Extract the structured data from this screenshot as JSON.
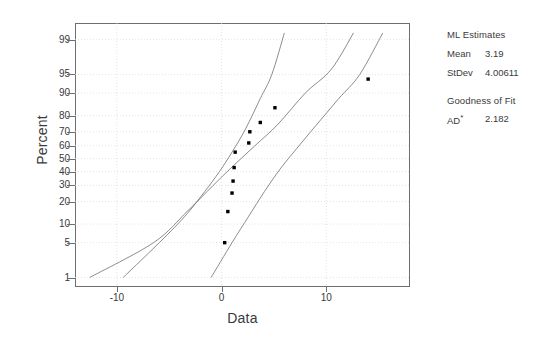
{
  "chart_data": {
    "type": "scatter",
    "title": "",
    "subtitle": "",
    "xlabel": "Data",
    "ylabel": "Percent",
    "grid": true,
    "legend_position": "right",
    "xlim": [
      -14,
      18
    ],
    "xticks": [
      -10,
      0,
      10
    ],
    "xtick_labels": [
      "-10",
      "0",
      "10"
    ],
    "ylim_percent": [
      0.6,
      99.6
    ],
    "yticks": [
      99,
      95,
      90,
      80,
      70,
      60,
      50,
      40,
      30,
      20,
      10,
      5,
      1
    ],
    "ytick_labels": [
      "99",
      "95",
      "90",
      "80",
      "70",
      "60",
      "50",
      "40",
      "30",
      "20",
      "10",
      "5",
      "1"
    ],
    "series": [
      {
        "name": "Data points",
        "type": "scatter",
        "marker": "square",
        "color": "#000000",
        "points": [
          {
            "x": 0.3,
            "percent": 5
          },
          {
            "x": 0.6,
            "percent": 15
          },
          {
            "x": 1.0,
            "percent": 25
          },
          {
            "x": 1.1,
            "percent": 33
          },
          {
            "x": 1.2,
            "percent": 43
          },
          {
            "x": 1.3,
            "percent": 55
          },
          {
            "x": 2.6,
            "percent": 62
          },
          {
            "x": 2.7,
            "percent": 70
          },
          {
            "x": 3.7,
            "percent": 76
          },
          {
            "x": 5.1,
            "percent": 84
          },
          {
            "x": 14.0,
            "percent": 94
          }
        ]
      },
      {
        "name": "Fitted normal line",
        "type": "line",
        "color": "#6e6e6e",
        "points": [
          {
            "x": -12.6,
            "percent": 1
          },
          {
            "x": -6.5,
            "percent": 5
          },
          {
            "x": -3.3,
            "percent": 15
          },
          {
            "x": -0.8,
            "percent": 30
          },
          {
            "x": 1.2,
            "percent": 45
          },
          {
            "x": 3.2,
            "percent": 60
          },
          {
            "x": 5.4,
            "percent": 75
          },
          {
            "x": 8.0,
            "percent": 90
          },
          {
            "x": 10.5,
            "percent": 96
          },
          {
            "x": 12.6,
            "percent": 99.3
          }
        ]
      },
      {
        "name": "Lower confidence bound",
        "type": "line",
        "color": "#6e6e6e",
        "points": [
          {
            "x": -9.4,
            "percent": 1
          },
          {
            "x": -5.5,
            "percent": 6
          },
          {
            "x": -3.3,
            "percent": 14
          },
          {
            "x": -1.6,
            "percent": 26
          },
          {
            "x": -0.2,
            "percent": 40
          },
          {
            "x": 1.0,
            "percent": 55
          },
          {
            "x": 2.3,
            "percent": 72
          },
          {
            "x": 3.7,
            "percent": 88
          },
          {
            "x": 4.8,
            "percent": 95
          },
          {
            "x": 6.0,
            "percent": 99.3
          }
        ]
      },
      {
        "name": "Upper confidence bound",
        "type": "line",
        "color": "#6e6e6e",
        "points": [
          {
            "x": -1.0,
            "percent": 1
          },
          {
            "x": 1.0,
            "percent": 5
          },
          {
            "x": 2.6,
            "percent": 13
          },
          {
            "x": 4.1,
            "percent": 26
          },
          {
            "x": 5.6,
            "percent": 42
          },
          {
            "x": 7.2,
            "percent": 58
          },
          {
            "x": 9.0,
            "percent": 74
          },
          {
            "x": 11.2,
            "percent": 88
          },
          {
            "x": 13.2,
            "percent": 95
          },
          {
            "x": 15.4,
            "percent": 99.3
          }
        ]
      }
    ],
    "annotations": {
      "ml_estimates_heading": "ML Estimates",
      "mean_label": "Mean",
      "mean_value": "3.19",
      "stdev_label": "StDev",
      "stdev_value": "4.00611",
      "goodness_heading": "Goodness of Fit",
      "ad_label": "AD",
      "ad_superscript": "*",
      "ad_value": "2.182"
    }
  },
  "axes": {
    "x": {
      "label": "Data",
      "ticks": [
        "-10",
        "0",
        "10"
      ]
    },
    "y": {
      "label": "Percent",
      "ticks": [
        "99",
        "95",
        "90",
        "80",
        "70",
        "60",
        "50",
        "40",
        "30",
        "20",
        "10",
        "5",
        "1"
      ]
    }
  },
  "stats_panel": {
    "ml_heading": "ML Estimates",
    "rows": [
      {
        "key": "Mean",
        "value": "3.19"
      },
      {
        "key": "StDev",
        "value": "4.00611"
      }
    ],
    "fit_heading": "Goodness of Fit",
    "fit_rows": [
      {
        "key": "AD",
        "sup": "*",
        "value": "2.182"
      }
    ]
  },
  "colors": {
    "axis": "#6e6e6e",
    "grid": "#d8d8d8",
    "marker": "#000000",
    "text": "#3a3a3a",
    "background": "#ffffff"
  }
}
